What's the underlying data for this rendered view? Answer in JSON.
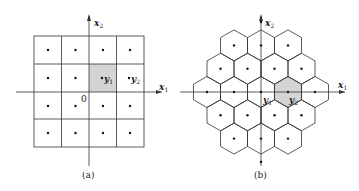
{
  "panel_a": {
    "caption": "(a)",
    "x_axis_label": "x",
    "x_axis_sub": "1",
    "y_axis_label": "x",
    "y_axis_sub": "2",
    "origin_label": "0",
    "point1_label": "y",
    "point1_sub": "1",
    "point2_label": "y",
    "point2_sub": "2",
    "grid": "4x4 square cells",
    "highlight_color": "#d4d4d4"
  },
  "panel_b": {
    "caption": "(b)",
    "x_axis_label": "x",
    "x_axis_sub": "1",
    "y_axis_label": "x",
    "y_axis_sub": "2",
    "point1_label": "y",
    "point1_sub": "1",
    "point2_label": "y",
    "point2_sub": "2",
    "grid": "hexagonal cells",
    "highlight_color": "#d4d4d4"
  }
}
